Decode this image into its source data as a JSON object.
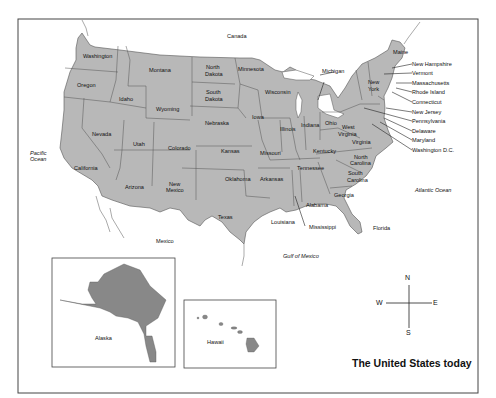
{
  "map": {
    "title": "The United States today",
    "colors": {
      "land": "#b8b8b8",
      "inset_land": "#888888",
      "border": "#555555",
      "frame": "#444444",
      "background": "#ffffff"
    },
    "water_labels": {
      "canada": "Canada",
      "pacific": "Pacific\nOcean",
      "pacific_line1": "Pacific",
      "pacific_line2": "Ocean",
      "atlantic": "Atlantic Ocean",
      "gulf": "Gulf of Mexico",
      "mexico": "Mexico"
    },
    "states": {
      "washington": "Washington",
      "oregon": "Oregon",
      "california": "California",
      "nevada": "Nevada",
      "idaho": "Idaho",
      "montana": "Montana",
      "wyoming": "Wyoming",
      "utah": "Utah",
      "arizona": "Arizona",
      "colorado": "Colorado",
      "new_mexico_1": "New",
      "new_mexico_2": "Mexico",
      "north_dakota_1": "North",
      "north_dakota_2": "Dakota",
      "south_dakota_1": "South",
      "south_dakota_2": "Dakota",
      "nebraska": "Nebraska",
      "kansas": "Kansas",
      "oklahoma": "Oklahoma",
      "texas": "Texas",
      "minnesota": "Minnesota",
      "iowa": "Iowa",
      "missouri": "Missouri",
      "arkansas": "Arkansas",
      "louisiana": "Louisiana",
      "wisconsin": "Wisconsin",
      "illinois": "Illinois",
      "michigan": "Michigan",
      "indiana": "Indiana",
      "ohio": "Ohio",
      "kentucky": "Kentucky",
      "tennessee": "Tennessee",
      "mississippi": "Mississippi",
      "alabama": "Alabama",
      "georgia": "Georgia",
      "florida": "Florida",
      "south_carolina_1": "South",
      "south_carolina_2": "Carolina",
      "north_carolina_1": "North",
      "north_carolina_2": "Carolina",
      "virginia": "Virginia",
      "west_virginia_1": "West",
      "west_virginia_2": "Virginia",
      "new_york_1": "New",
      "new_york_2": "York",
      "maine": "Maine",
      "alaska": "Alaska",
      "hawaii": "Hawaii"
    },
    "callouts": [
      "New Hampshire",
      "Vermont",
      "Massachusetts",
      "Rhode Island",
      "Connecticut",
      "New Jersey",
      "Pennsylvania",
      "Delaware",
      "Maryland",
      "Washington D.C."
    ],
    "compass": {
      "n": "N",
      "s": "S",
      "e": "E",
      "w": "W"
    }
  }
}
